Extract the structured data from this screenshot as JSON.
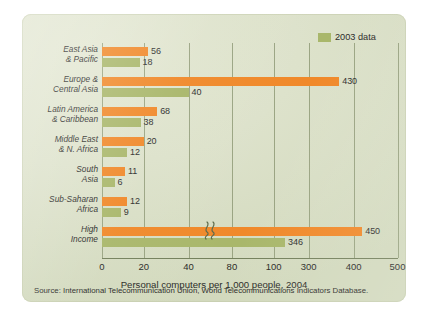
{
  "figure": {
    "legend": {
      "label": "2003 data",
      "swatch_color": "#a9b76b",
      "position": "top-right"
    },
    "axis_title": "Personal computers per 1,000 people, 2004",
    "source": "Source: International Telecommunication Union, World Telecommunications Indicators Database.",
    "colors": {
      "bar_2004": "#f0892a",
      "bar_2003": "#a9b76b",
      "panel_background": "#dde2cb",
      "gridline": "#8f9a77",
      "text": "#2b2b28"
    }
  },
  "chart_data": {
    "type": "bar",
    "orientation": "horizontal",
    "title": "",
    "subtitle": "",
    "xlabel": "Personal computers per 1,000 people, 2004",
    "ylabel": "",
    "xlim": [
      0,
      500
    ],
    "grid": true,
    "axis_break": {
      "present": true,
      "between": [
        100,
        300
      ]
    },
    "xticks": [
      {
        "label": "0",
        "value": 0,
        "pos": 0
      },
      {
        "label": "20",
        "value": 20,
        "pos": 41.7
      },
      {
        "label": "40",
        "value": 40,
        "pos": 86.6
      },
      {
        "label": "80",
        "value": 80,
        "pos": 129.9
      },
      {
        "label": "100",
        "value": 100,
        "pos": 171.6
      },
      {
        "label": "300",
        "value": 300,
        "pos": 206.6
      },
      {
        "label": "400",
        "value": 400,
        "pos": 251.6
      },
      {
        "label": "500",
        "value": 500,
        "pos": 295.5
      }
    ],
    "categories": [
      "East Asia & Pacific",
      "Europe & Central Asia",
      "Latin America & Caribbean",
      "Middle East & N. Africa",
      "South Asia",
      "Sub-Saharan Africa",
      "High Income"
    ],
    "category_lines": [
      [
        "East Asia",
        "& Pacific"
      ],
      [
        "Europe &",
        "Central Asia"
      ],
      [
        "Latin America",
        "& Caribbean"
      ],
      [
        "Middle East",
        "& N. Africa"
      ],
      [
        "South",
        "Asia"
      ],
      [
        "Sub-Saharan",
        "Africa"
      ],
      [
        "High",
        "Income"
      ]
    ],
    "series": [
      {
        "name": "2004",
        "color": "#f0892a",
        "values": [
          56,
          430,
          68,
          20,
          11,
          12,
          450
        ]
      },
      {
        "name": "2003 data",
        "color": "#a9b76b",
        "values": [
          18,
          40,
          38,
          12,
          6,
          9,
          346
        ]
      }
    ],
    "bar_pixels": [
      {
        "top": 46.1,
        "bottom": 37.5
      },
      {
        "top": 237.3,
        "bottom": 86.6
      },
      {
        "top": 55.2,
        "bottom": 38.6
      },
      {
        "top": 41.7,
        "bottom": 25.0
      },
      {
        "top": 22.9,
        "bottom": 12.5
      },
      {
        "top": 25.0,
        "bottom": 18.8
      },
      {
        "top": 260.3,
        "bottom": 183.1
      }
    ],
    "group_tops": [
      4,
      34,
      64,
      94,
      124,
      154,
      184
    ]
  }
}
